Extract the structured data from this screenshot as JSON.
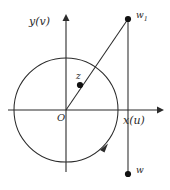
{
  "figure": {
    "background_color": "#ffffff",
    "stroke_color": "#2b2b2b",
    "point_color": "#111111",
    "axes": {
      "x_label": "x(u)",
      "y_label": "y(v)",
      "origin_label": "O"
    },
    "points": [
      {
        "id": "z",
        "label": "z",
        "x": 80,
        "y": 85
      },
      {
        "id": "w1",
        "label": "w",
        "sub": "1",
        "x": 128,
        "y": 19
      },
      {
        "id": "w",
        "label": "w",
        "x": 128,
        "y": 174
      }
    ],
    "circle": {
      "center_x": 66,
      "center_y": 110,
      "radius": 52,
      "direction_marker": "counterclockwise-arrow"
    },
    "lines": [
      {
        "id": "ray-origin-to-w1",
        "from": "O",
        "to": "w1"
      },
      {
        "id": "vertical-w1-to-w",
        "from": "w1",
        "to": "w"
      }
    ]
  }
}
